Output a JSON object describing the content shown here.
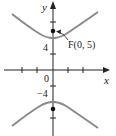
{
  "figure": {
    "type": "hyperbola",
    "equation_hint": "vertical hyperbola with vertices at (0, ±4) and foci at (0, ±5)",
    "axes": {
      "x_label": "x",
      "y_label": "y",
      "origin_label": "0"
    },
    "tick_labels": {
      "y_positive": "4",
      "y_negative": "−4"
    },
    "focus_label": "F(0, 5)",
    "colors": {
      "curve": "#8a8a8a",
      "axis": "#222222",
      "focus": "#111111"
    }
  }
}
